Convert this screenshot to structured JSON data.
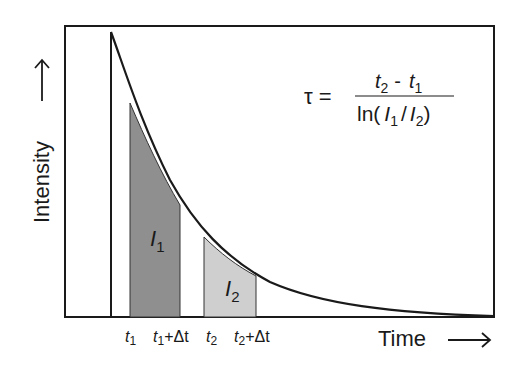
{
  "diagram": {
    "y_axis_label": "Intensity",
    "x_axis_label": "Time",
    "arrow_glyph": "⟶",
    "formula": {
      "lhs": "τ =",
      "numerator_t2": "t",
      "numerator_t2_sub": "2",
      "numerator_minus": "-",
      "numerator_t1": "t",
      "numerator_t1_sub": "1",
      "denominator_ln": "ln(",
      "denominator_I1": "I",
      "denominator_I1_sub": "1",
      "denominator_slash": "/",
      "denominator_I2": "I",
      "denominator_I2_sub": "2",
      "denominator_close": ")"
    },
    "regions": [
      {
        "label": "I",
        "sub": "1",
        "color": "#8f8f8f"
      },
      {
        "label": "I",
        "sub": "2",
        "color": "#cfcfcf"
      }
    ],
    "ticks": [
      {
        "t": "t",
        "sub": "1",
        "suffix": ""
      },
      {
        "t": "t",
        "sub": "1",
        "suffix": "+Δt"
      },
      {
        "t": "t",
        "sub": "2",
        "suffix": ""
      },
      {
        "t": "t",
        "sub": "2",
        "suffix": "+Δt"
      }
    ],
    "colors": {
      "line": "#1a1a1a",
      "frame": "#1a1a1a",
      "region1": "#8f8f8f",
      "region2": "#cfcfcf",
      "background": "#ffffff"
    }
  }
}
